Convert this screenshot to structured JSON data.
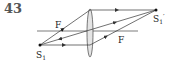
{
  "problem_number": "43",
  "labels": {
    "focus_left": "F",
    "focus_right": "F",
    "source": "S",
    "source_sub": "1",
    "image": "S",
    "image_sub": "1",
    "image_prime": "′"
  },
  "colors": {
    "line": "#333333",
    "lens_fill": "#dddddd"
  }
}
